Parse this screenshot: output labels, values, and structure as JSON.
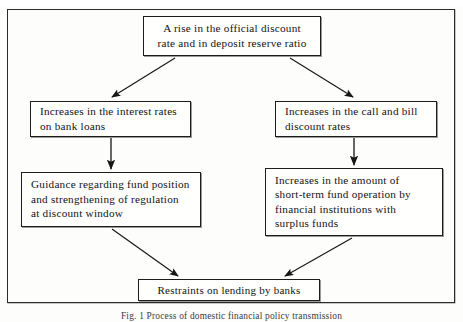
{
  "figure": {
    "type": "flowchart",
    "caption": "Fig. 1  Process of domestic financial policy transmission",
    "frame": {
      "border_color": "#2b2b2b"
    },
    "nodes": [
      {
        "id": "top",
        "name": "official-discount-rate-rise",
        "lines": [
          "A rise in the official discount",
          "rate and in deposit reserve ratio"
        ]
      },
      {
        "id": "left-1",
        "name": "interest-rates-bank-loans",
        "lines": [
          "Increases in the interest rates",
          "on bank loans"
        ]
      },
      {
        "id": "right-1",
        "name": "call-and-bill-discount-rates",
        "lines": [
          "Increases in the call and bill",
          "discount rates"
        ]
      },
      {
        "id": "left-2",
        "name": "guidance-fund-position",
        "lines": [
          "Guidance regarding fund position",
          "and strengthening of regulation",
          "at discount window"
        ]
      },
      {
        "id": "right-2",
        "name": "short-term-fund-operation",
        "lines": [
          "Increases in the amount of",
          "short-term fund operation by",
          "financial institutions with",
          "surplus funds"
        ]
      },
      {
        "id": "bottom",
        "name": "restraints-on-lending",
        "lines": [
          "Restraints on lending by banks"
        ]
      }
    ],
    "edges": [
      {
        "from": "top",
        "to": "left-1",
        "style": "diagonal-arrow"
      },
      {
        "from": "top",
        "to": "right-1",
        "style": "diagonal-arrow"
      },
      {
        "from": "left-1",
        "to": "left-2",
        "style": "vertical-arrow"
      },
      {
        "from": "right-1",
        "to": "right-2",
        "style": "vertical-arrow"
      },
      {
        "from": "left-2",
        "to": "bottom",
        "style": "diagonal-arrow"
      },
      {
        "from": "right-2",
        "to": "bottom",
        "style": "diagonal-arrow"
      }
    ]
  }
}
